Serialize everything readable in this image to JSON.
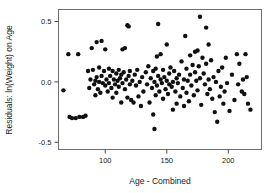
{
  "chart_data": {
    "type": "scatter",
    "title": "",
    "xlabel": "Age - Combined",
    "ylabel": "Residuals: ln(Weight) on Age",
    "xlim": [
      62,
      227
    ],
    "ylim": [
      -0.56,
      0.6
    ],
    "xticks": [
      100,
      150,
      200
    ],
    "xtick_labels": [
      "100",
      "150",
      "200"
    ],
    "yticks": [
      0.5,
      0.0,
      -0.5
    ],
    "ytick_labels": [
      "0.5",
      "0.0",
      "-0.5"
    ],
    "grid": false,
    "legend": null,
    "marker": "filled-circle",
    "marker_color": "#101010",
    "marker_size": 2.2,
    "frame_color": "#6e6e6e",
    "points": [
      [
        66,
        -0.07
      ],
      [
        70,
        0.23
      ],
      [
        71,
        -0.29
      ],
      [
        73,
        -0.3
      ],
      [
        76,
        -0.3
      ],
      [
        78,
        0.23
      ],
      [
        79,
        -0.29
      ],
      [
        82,
        -0.29
      ],
      [
        84,
        -0.28
      ],
      [
        86,
        0.09
      ],
      [
        87,
        -0.05
      ],
      [
        88,
        0.02
      ],
      [
        89,
        0.28
      ],
      [
        90,
        0.1
      ],
      [
        91,
        -0.02
      ],
      [
        92,
        0.01
      ],
      [
        92,
        -0.11
      ],
      [
        93,
        0.33
      ],
      [
        93,
        0.04
      ],
      [
        94,
        -0.06
      ],
      [
        95,
        0.12
      ],
      [
        95,
        0.0
      ],
      [
        96,
        -0.09
      ],
      [
        97,
        0.34
      ],
      [
        97,
        0.05
      ],
      [
        98,
        -0.01
      ],
      [
        99,
        0.09
      ],
      [
        100,
        -0.03
      ],
      [
        100,
        0.27
      ],
      [
        101,
        0.02
      ],
      [
        102,
        -0.08
      ],
      [
        103,
        0.11
      ],
      [
        103,
        -0.01
      ],
      [
        104,
        0.05
      ],
      [
        105,
        -0.05
      ],
      [
        106,
        0.09
      ],
      [
        106,
        -0.13
      ],
      [
        107,
        0.02
      ],
      [
        108,
        -0.02
      ],
      [
        109,
        0.07
      ],
      [
        109,
        -0.09
      ],
      [
        110,
        0.01
      ],
      [
        111,
        0.1
      ],
      [
        111,
        -0.04
      ],
      [
        112,
        0.03
      ],
      [
        113,
        -0.17
      ],
      [
        113,
        0.06
      ],
      [
        114,
        0.27
      ],
      [
        114,
        -0.01
      ],
      [
        115,
        0.08
      ],
      [
        116,
        0.28
      ],
      [
        116,
        -0.06
      ],
      [
        117,
        0.02
      ],
      [
        118,
        0.47
      ],
      [
        118,
        -0.13
      ],
      [
        119,
        0.46
      ],
      [
        119,
        0.05
      ],
      [
        120,
        -0.02
      ],
      [
        120,
        0.09
      ],
      [
        121,
        -0.15
      ],
      [
        122,
        0.01
      ],
      [
        123,
        -0.17
      ],
      [
        124,
        0.06
      ],
      [
        125,
        -0.03
      ],
      [
        126,
        0.1
      ],
      [
        127,
        -0.12
      ],
      [
        128,
        0.0
      ],
      [
        129,
        -0.2
      ],
      [
        130,
        0.04
      ],
      [
        131,
        -0.08
      ],
      [
        133,
        0.08
      ],
      [
        134,
        -0.02
      ],
      [
        135,
        0.13
      ],
      [
        136,
        -0.17
      ],
      [
        137,
        0.03
      ],
      [
        138,
        -0.05
      ],
      [
        139,
        0.09
      ],
      [
        139,
        -0.27
      ],
      [
        140,
        0.0
      ],
      [
        140,
        -0.39
      ],
      [
        141,
        0.11
      ],
      [
        141,
        -0.11
      ],
      [
        142,
        0.21
      ],
      [
        142,
        -0.03
      ],
      [
        143,
        0.48
      ],
      [
        143,
        0.05
      ],
      [
        144,
        -0.08
      ],
      [
        145,
        0.02
      ],
      [
        145,
        0.23
      ],
      [
        146,
        -0.01
      ],
      [
        147,
        0.1
      ],
      [
        147,
        -0.14
      ],
      [
        148,
        0.04
      ],
      [
        149,
        -0.06
      ],
      [
        150,
        0.31
      ],
      [
        150,
        0.01
      ],
      [
        151,
        -0.1
      ],
      [
        152,
        0.07
      ],
      [
        152,
        -0.02
      ],
      [
        153,
        0.12
      ],
      [
        154,
        -0.04
      ],
      [
        155,
        0.0
      ],
      [
        155,
        -0.23
      ],
      [
        156,
        0.09
      ],
      [
        157,
        -0.08
      ],
      [
        158,
        0.03
      ],
      [
        158,
        -0.18
      ],
      [
        159,
        -0.01
      ],
      [
        160,
        0.06
      ],
      [
        161,
        -0.12
      ],
      [
        162,
        0.17
      ],
      [
        163,
        -0.05
      ],
      [
        164,
        0.02
      ],
      [
        164,
        -0.2
      ],
      [
        165,
        0.38
      ],
      [
        166,
        0.11
      ],
      [
        166,
        -0.09
      ],
      [
        167,
        0.01
      ],
      [
        168,
        -0.16
      ],
      [
        169,
        0.22
      ],
      [
        169,
        0.06
      ],
      [
        170,
        -0.03
      ],
      [
        171,
        0.14
      ],
      [
        172,
        -0.11
      ],
      [
        173,
        0.25
      ],
      [
        173,
        0.08
      ],
      [
        174,
        0.01
      ],
      [
        175,
        0.26
      ],
      [
        175,
        -0.07
      ],
      [
        176,
        0.13
      ],
      [
        177,
        0.54
      ],
      [
        177,
        0.03
      ],
      [
        178,
        -0.19
      ],
      [
        179,
        0.2
      ],
      [
        180,
        0.07
      ],
      [
        181,
        -0.02
      ],
      [
        182,
        0.45
      ],
      [
        182,
        0.15
      ],
      [
        183,
        -0.1
      ],
      [
        184,
        0.31
      ],
      [
        184,
        0.02
      ],
      [
        185,
        -0.06
      ],
      [
        186,
        0.18
      ],
      [
        187,
        -0.14
      ],
      [
        188,
        0.04
      ],
      [
        189,
        -0.25
      ],
      [
        190,
        0.0
      ],
      [
        191,
        -0.33
      ],
      [
        192,
        0.09
      ],
      [
        193,
        -0.12
      ],
      [
        194,
        -0.04
      ],
      [
        195,
        0.12
      ],
      [
        196,
        -0.18
      ],
      [
        197,
        -0.08
      ],
      [
        198,
        0.2
      ],
      [
        199,
        -0.01
      ],
      [
        201,
        -0.24
      ],
      [
        203,
        0.06
      ],
      [
        205,
        -0.15
      ],
      [
        207,
        0.23
      ],
      [
        208,
        -0.02
      ],
      [
        209,
        0.15
      ],
      [
        211,
        -0.08
      ],
      [
        212,
        0.02
      ],
      [
        213,
        -0.1
      ],
      [
        214,
        0.23
      ],
      [
        215,
        0.04
      ],
      [
        216,
        -0.18
      ],
      [
        218,
        -0.23
      ]
    ]
  },
  "axes": {
    "xlabel": "Age - Combined",
    "ylabel": "Residuals: ln(Weight) on Age"
  },
  "ticks": {
    "x": [
      "100",
      "150",
      "200"
    ],
    "y": [
      "0.5",
      "0.0",
      "-0.5"
    ]
  }
}
